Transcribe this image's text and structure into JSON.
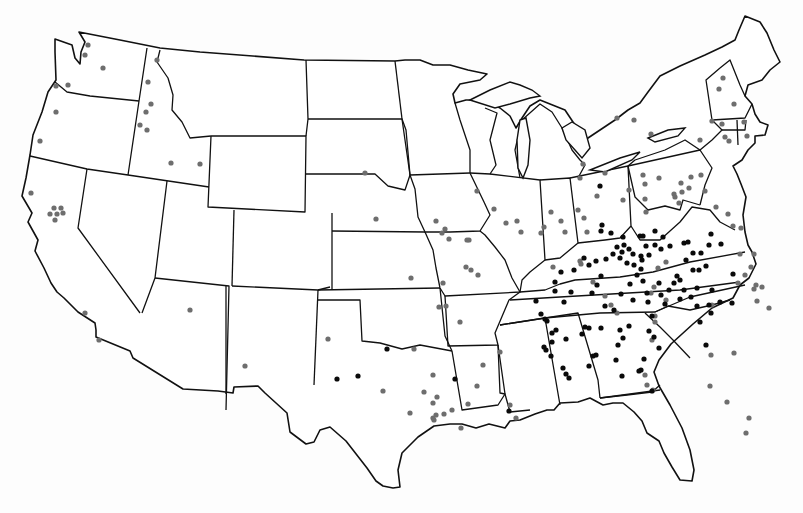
{
  "map": {
    "title": "",
    "subject": "United States dot distribution map with state boundaries",
    "legend": [],
    "colors": {
      "background": "#fdfdfd",
      "border": "#111111",
      "dot_gray": "#6e6e6e",
      "dot_black": "#0a0a0a"
    },
    "dot_classes": [
      {
        "id": "gray",
        "color": "#6e6e6e",
        "radius": 2.6
      },
      {
        "id": "black",
        "color": "#0a0a0a",
        "radius": 2.6
      }
    ],
    "dots_gray": [
      [
        88,
        45
      ],
      [
        85,
        55
      ],
      [
        103,
        68
      ],
      [
        56,
        86
      ],
      [
        56,
        112
      ],
      [
        40,
        141
      ],
      [
        68,
        85
      ],
      [
        157,
        60
      ],
      [
        148,
        82
      ],
      [
        151,
        104
      ],
      [
        146,
        112
      ],
      [
        140,
        125
      ],
      [
        147,
        130
      ],
      [
        171,
        163
      ],
      [
        200,
        164
      ],
      [
        31,
        193
      ],
      [
        54,
        208
      ],
      [
        61,
        208
      ],
      [
        50,
        214
      ],
      [
        57,
        214
      ],
      [
        63,
        213
      ],
      [
        55,
        220
      ],
      [
        85,
        313
      ],
      [
        99,
        340
      ],
      [
        190,
        310
      ],
      [
        245,
        366
      ],
      [
        328,
        339
      ],
      [
        383,
        391
      ],
      [
        410,
        413
      ],
      [
        424,
        392
      ],
      [
        437,
        397
      ],
      [
        477,
        386
      ],
      [
        483,
        365
      ],
      [
        436,
        221
      ],
      [
        411,
        278
      ],
      [
        365,
        173
      ],
      [
        376,
        219
      ],
      [
        445,
        229
      ],
      [
        442,
        233
      ],
      [
        449,
        239
      ],
      [
        469,
        240
      ],
      [
        466,
        267
      ],
      [
        471,
        270
      ],
      [
        478,
        275
      ],
      [
        494,
        209
      ],
      [
        477,
        191
      ],
      [
        506,
        223
      ],
      [
        521,
        232
      ],
      [
        517,
        221
      ],
      [
        460,
        322
      ],
      [
        446,
        306
      ],
      [
        414,
        349
      ],
      [
        500,
        352
      ],
      [
        439,
        307
      ],
      [
        433,
        375
      ],
      [
        433,
        403
      ],
      [
        433,
        418
      ],
      [
        436,
        415
      ],
      [
        444,
        414
      ],
      [
        468,
        404
      ],
      [
        510,
        405
      ],
      [
        516,
        418
      ],
      [
        467,
        240
      ],
      [
        443,
        283
      ],
      [
        461,
        428
      ],
      [
        452,
        410
      ],
      [
        434,
        420
      ],
      [
        617,
        118
      ],
      [
        634,
        120
      ],
      [
        651,
        134
      ],
      [
        723,
        78
      ],
      [
        719,
        89
      ],
      [
        734,
        104
      ],
      [
        712,
        121
      ],
      [
        722,
        124
      ],
      [
        744,
        122
      ],
      [
        725,
        137
      ],
      [
        729,
        141
      ],
      [
        700,
        140
      ],
      [
        747,
        136
      ],
      [
        629,
        190
      ],
      [
        623,
        200
      ],
      [
        643,
        175
      ],
      [
        645,
        184
      ],
      [
        645,
        199
      ],
      [
        659,
        178
      ],
      [
        681,
        183
      ],
      [
        691,
        177
      ],
      [
        674,
        194
      ],
      [
        682,
        192
      ],
      [
        689,
        188
      ],
      [
        701,
        175
      ],
      [
        675,
        197
      ],
      [
        679,
        203
      ],
      [
        705,
        191
      ],
      [
        716,
        207
      ],
      [
        728,
        214
      ],
      [
        733,
        226
      ],
      [
        741,
        228
      ],
      [
        583,
        164
      ],
      [
        580,
        178
      ],
      [
        605,
        173
      ],
      [
        597,
        196
      ],
      [
        578,
        210
      ],
      [
        551,
        212
      ],
      [
        544,
        227
      ],
      [
        561,
        221
      ],
      [
        541,
        233
      ],
      [
        584,
        218
      ],
      [
        587,
        232
      ],
      [
        565,
        232
      ],
      [
        553,
        267
      ],
      [
        646,
        212
      ],
      [
        666,
        262
      ],
      [
        658,
        268
      ],
      [
        654,
        287
      ],
      [
        651,
        293
      ],
      [
        666,
        300
      ],
      [
        712,
        305
      ],
      [
        734,
        353
      ],
      [
        711,
        355
      ],
      [
        710,
        386
      ],
      [
        727,
        402
      ],
      [
        749,
        418
      ],
      [
        746,
        433
      ],
      [
        754,
        254
      ],
      [
        740,
        254
      ],
      [
        751,
        267
      ],
      [
        738,
        283
      ],
      [
        745,
        275
      ],
      [
        756,
        285
      ],
      [
        762,
        287
      ],
      [
        754,
        289
      ],
      [
        757,
        301
      ],
      [
        769,
        308
      ],
      [
        580,
        261
      ],
      [
        581,
        264
      ],
      [
        593,
        282
      ],
      [
        605,
        296
      ],
      [
        611,
        305
      ],
      [
        617,
        313
      ],
      [
        655,
        322
      ],
      [
        655,
        316
      ],
      [
        652,
        340
      ],
      [
        645,
        375
      ],
      [
        647,
        385
      ],
      [
        653,
        390
      ]
    ],
    "dots_black": [
      [
        600,
        186
      ],
      [
        602,
        225
      ],
      [
        601,
        231
      ],
      [
        611,
        233
      ],
      [
        623,
        237
      ],
      [
        624,
        245
      ],
      [
        629,
        249
      ],
      [
        613,
        254
      ],
      [
        606,
        259
      ],
      [
        596,
        261
      ],
      [
        589,
        265
      ],
      [
        584,
        258
      ],
      [
        620,
        258
      ],
      [
        627,
        263
      ],
      [
        634,
        265
      ],
      [
        641,
        269
      ],
      [
        633,
        254
      ],
      [
        641,
        256
      ],
      [
        622,
        252
      ],
      [
        617,
        247
      ],
      [
        646,
        246
      ],
      [
        649,
        255
      ],
      [
        661,
        249
      ],
      [
        637,
        275
      ],
      [
        643,
        281
      ],
      [
        630,
        284
      ],
      [
        621,
        294
      ],
      [
        633,
        300
      ],
      [
        614,
        310
      ],
      [
        605,
        306
      ],
      [
        601,
        276
      ],
      [
        597,
        285
      ],
      [
        592,
        293
      ],
      [
        574,
        270
      ],
      [
        561,
        272
      ],
      [
        555,
        282
      ],
      [
        555,
        291
      ],
      [
        571,
        292
      ],
      [
        564,
        302
      ],
      [
        547,
        321
      ],
      [
        552,
        333
      ],
      [
        552,
        342
      ],
      [
        546,
        350
      ],
      [
        566,
        339
      ],
      [
        582,
        334
      ],
      [
        589,
        328
      ],
      [
        601,
        328
      ],
      [
        659,
        283
      ],
      [
        648,
        302
      ],
      [
        674,
        283
      ],
      [
        677,
        276
      ],
      [
        669,
        290
      ],
      [
        661,
        295
      ],
      [
        680,
        280
      ],
      [
        686,
        260
      ],
      [
        693,
        253
      ],
      [
        701,
        253
      ],
      [
        709,
        245
      ],
      [
        721,
        244
      ],
      [
        711,
        234
      ],
      [
        684,
        243
      ],
      [
        670,
        246
      ],
      [
        655,
        245
      ],
      [
        663,
        237
      ],
      [
        688,
        242
      ],
      [
        680,
        299
      ],
      [
        691,
        297
      ],
      [
        684,
        290
      ],
      [
        697,
        288
      ],
      [
        693,
        270
      ],
      [
        699,
        270
      ],
      [
        706,
        266
      ],
      [
        697,
        306
      ],
      [
        709,
        305
      ],
      [
        711,
        313
      ],
      [
        700,
        322
      ],
      [
        720,
        302
      ],
      [
        732,
        303
      ],
      [
        733,
        274
      ],
      [
        712,
        290
      ],
      [
        655,
        231
      ],
      [
        643,
        236
      ],
      [
        665,
        304
      ],
      [
        652,
        316
      ],
      [
        659,
        348
      ],
      [
        644,
        359
      ],
      [
        641,
        370
      ],
      [
        620,
        330
      ],
      [
        618,
        345
      ],
      [
        596,
        355
      ],
      [
        589,
        366
      ],
      [
        563,
        368
      ],
      [
        566,
        374
      ],
      [
        569,
        378
      ],
      [
        585,
        327
      ],
      [
        593,
        356
      ],
      [
        616,
        360
      ],
      [
        652,
        391
      ],
      [
        706,
        345
      ],
      [
        642,
        260
      ],
      [
        640,
        236
      ],
      [
        647,
        293
      ],
      [
        629,
        326
      ],
      [
        623,
        338
      ],
      [
        649,
        331
      ],
      [
        654,
        337
      ],
      [
        387,
        349
      ],
      [
        358,
        376
      ],
      [
        337,
        379
      ],
      [
        455,
        379
      ],
      [
        509,
        411
      ],
      [
        536,
        301
      ],
      [
        541,
        314
      ],
      [
        545,
        319
      ],
      [
        556,
        330
      ],
      [
        544,
        347
      ],
      [
        551,
        356
      ],
      [
        622,
        376
      ],
      [
        639,
        371
      ]
    ]
  }
}
